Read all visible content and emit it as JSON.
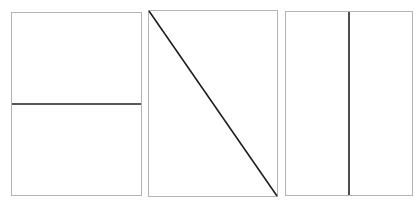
{
  "line_color": "#1e1e1e",
  "border_color": "#b4b4b4",
  "background_color": "#ffffff",
  "panels": [
    {
      "label": "Panel with horizontal line",
      "line": "horizontal"
    },
    {
      "label": "Panel with diagonal line",
      "line": "diagonal-top-left-to-bottom-right"
    },
    {
      "label": "Panel with vertical line",
      "line": "vertical"
    }
  ]
}
